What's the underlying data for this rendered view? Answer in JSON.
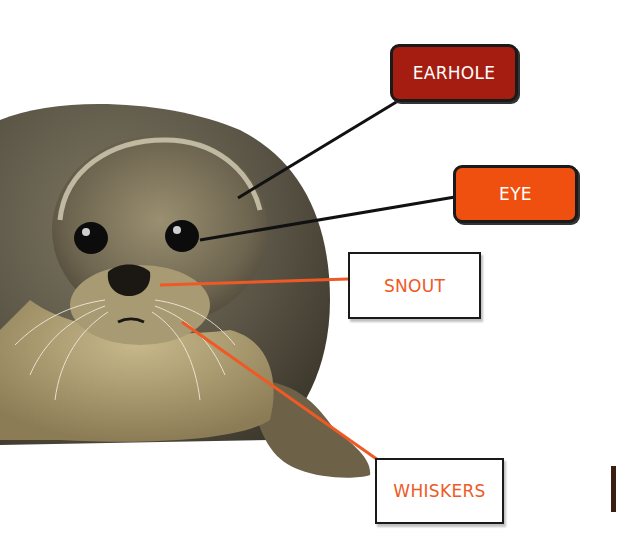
{
  "diagram": {
    "labels": [
      {
        "id": "earhole",
        "text": "EARHOLE",
        "style": "filled",
        "fill": "#a51d10",
        "text_color": "#ffffff",
        "box": [
          390,
          44,
          128,
          58
        ],
        "pointer": [
          [
            398,
            101
          ],
          [
            238,
            198
          ]
        ],
        "line_color": "#111111"
      },
      {
        "id": "eye",
        "text": "EYE",
        "style": "filled",
        "fill": "#f0500f",
        "text_color": "#ffffff",
        "box": [
          453,
          165,
          125,
          58
        ],
        "pointer": [
          [
            455,
            197
          ],
          [
            200,
            240
          ]
        ],
        "line_color": "#111111"
      },
      {
        "id": "snout",
        "text": "SNOUT",
        "style": "outline",
        "fill": "#ffffff",
        "text_color": "#ee5a25",
        "box": [
          348,
          252,
          133,
          67
        ],
        "pointer": [
          [
            348,
            279
          ],
          [
            160,
            285
          ]
        ],
        "line_color": "#ee5a25"
      },
      {
        "id": "whiskers",
        "text": "WHISKERS",
        "style": "outline",
        "fill": "#ffffff",
        "text_color": "#ee5a25",
        "box": [
          375,
          458,
          129,
          66
        ],
        "pointer": [
          [
            378,
            460
          ],
          [
            182,
            322
          ]
        ],
        "line_color": "#ee5a25"
      }
    ]
  }
}
